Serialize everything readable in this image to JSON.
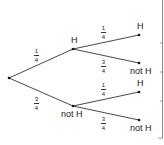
{
  "diagram": {
    "type": "probability-tree",
    "root": {
      "x": 9,
      "y": 78
    },
    "level1": [
      {
        "label": "H",
        "prob_num": "1",
        "prob_den": "4",
        "x": 73,
        "y": 49
      },
      {
        "label": "not H",
        "prob_num": "3",
        "prob_den": "4",
        "x": 73,
        "y": 106
      }
    ],
    "level2": [
      {
        "parent": 0,
        "label": "H",
        "prob_num": "1",
        "prob_den": "4",
        "x": 139,
        "y": 35
      },
      {
        "parent": 0,
        "label": "not H",
        "prob_num": "3",
        "prob_den": "4",
        "x": 139,
        "y": 63
      },
      {
        "parent": 1,
        "label": "H",
        "prob_num": "1",
        "prob_den": "4",
        "x": 139,
        "y": 92
      },
      {
        "parent": 1,
        "label": "not H",
        "prob_num": "3",
        "prob_den": "4",
        "x": 139,
        "y": 120
      }
    ]
  },
  "colors": {
    "line": "#333333",
    "text": "#1a1a1a",
    "border": "#888888"
  }
}
